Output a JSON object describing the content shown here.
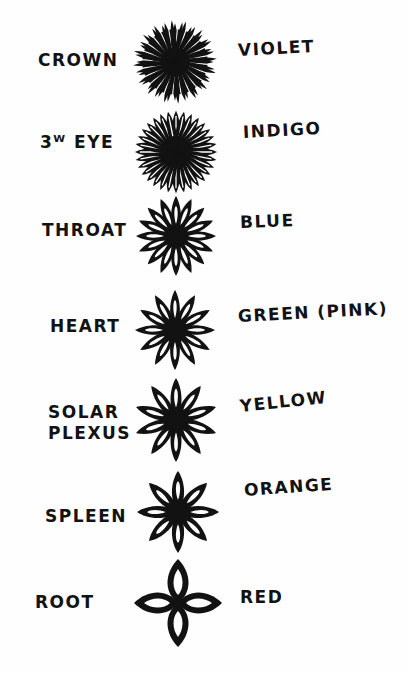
{
  "diagram": {
    "type": "chakra-chart",
    "background": "#fefefe",
    "ink": "#121212",
    "chakras": [
      {
        "name": "CROWN",
        "name_lines": [
          "CROWN"
        ],
        "color": "VIOLET",
        "petals": 48,
        "style": "spiky",
        "cx": 175,
        "cy": 62,
        "r": 42,
        "name_pos": [
          38,
          50
        ],
        "color_pos": [
          238,
          40
        ],
        "color_rot": -3
      },
      {
        "name": "3ᵂ EYE",
        "name_lines": [
          "3ᵂ EYE"
        ],
        "color": "INDIGO",
        "petals": 32,
        "style": "dense",
        "cx": 176,
        "cy": 152,
        "r": 42,
        "name_pos": [
          40,
          132
        ],
        "color_pos": [
          243,
          122
        ],
        "color_rot": -3
      },
      {
        "name": "THROAT",
        "name_lines": [
          "THROAT"
        ],
        "color": "BLUE",
        "petals": 16,
        "style": "petal",
        "cx": 176,
        "cy": 236,
        "r": 40,
        "name_pos": [
          42,
          220
        ],
        "color_pos": [
          240,
          212
        ],
        "color_rot": -2
      },
      {
        "name": "HEART",
        "name_lines": [
          "HEART"
        ],
        "color": "GREEN (PINK)",
        "petals": 12,
        "style": "petal",
        "cx": 175,
        "cy": 330,
        "r": 40,
        "name_pos": [
          50,
          316
        ],
        "color_pos": [
          238,
          306
        ],
        "color_rot": -3
      },
      {
        "name": "SOLAR PLEXUS",
        "name_lines": [
          "SOLAR",
          "PLEXUS"
        ],
        "color": "YELLOW",
        "petals": 10,
        "style": "petal",
        "cx": 176,
        "cy": 420,
        "r": 42,
        "name_pos": [
          48,
          402
        ],
        "color_pos": [
          240,
          396
        ],
        "color_rot": -6
      },
      {
        "name": "SPLEEN",
        "name_lines": [
          "SPLEEN"
        ],
        "color": "ORANGE",
        "petals": 8,
        "style": "petal",
        "cx": 178,
        "cy": 512,
        "r": 41,
        "name_pos": [
          45,
          506
        ],
        "color_pos": [
          244,
          480
        ],
        "color_rot": -4
      },
      {
        "name": "ROOT",
        "name_lines": [
          "ROOT"
        ],
        "color": "RED",
        "petals": 4,
        "style": "lobe",
        "cx": 178,
        "cy": 603,
        "r": 44,
        "name_pos": [
          35,
          592
        ],
        "color_pos": [
          240,
          587
        ],
        "color_rot": 0
      }
    ]
  }
}
